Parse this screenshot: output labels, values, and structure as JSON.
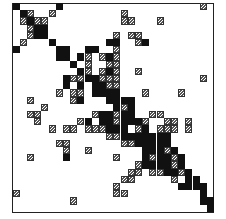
{
  "figure": {
    "type": "sparse-matrix-pattern",
    "grid": {
      "cols": 28,
      "rows": 29,
      "cell_w": 7.2,
      "cell_h": 7.2,
      "origin_x": 13,
      "origin_y": 3.5
    },
    "legend": {
      "b": "filled (black)",
      "h": "hatched"
    },
    "colors": {
      "filled": "#111111",
      "hatched_stroke": "#555555",
      "border": "#222222"
    },
    "cells": [
      [
        0,
        0,
        "b"
      ],
      [
        0,
        6,
        "b"
      ],
      [
        0,
        26,
        "h"
      ],
      [
        1,
        1,
        "b"
      ],
      [
        1,
        2,
        "h"
      ],
      [
        1,
        5,
        "h"
      ],
      [
        1,
        15,
        "h"
      ],
      [
        2,
        1,
        "h"
      ],
      [
        2,
        2,
        "b"
      ],
      [
        2,
        3,
        "h"
      ],
      [
        2,
        4,
        "h"
      ],
      [
        2,
        15,
        "h"
      ],
      [
        2,
        16,
        "h"
      ],
      [
        2,
        20,
        "h"
      ],
      [
        3,
        2,
        "h"
      ],
      [
        3,
        3,
        "b"
      ],
      [
        3,
        4,
        "b"
      ],
      [
        4,
        2,
        "h"
      ],
      [
        4,
        3,
        "b"
      ],
      [
        4,
        4,
        "b"
      ],
      [
        4,
        14,
        "h"
      ],
      [
        4,
        16,
        "h"
      ],
      [
        4,
        17,
        "h"
      ],
      [
        5,
        1,
        "h"
      ],
      [
        5,
        5,
        "b"
      ],
      [
        5,
        13,
        "b"
      ],
      [
        5,
        14,
        "b"
      ],
      [
        5,
        17,
        "h"
      ],
      [
        5,
        18,
        "b"
      ],
      [
        6,
        0,
        "b"
      ],
      [
        6,
        6,
        "b"
      ],
      [
        6,
        7,
        "b"
      ],
      [
        6,
        14,
        "h"
      ],
      [
        6,
        10,
        "b"
      ],
      [
        6,
        11,
        "b"
      ],
      [
        7,
        6,
        "b"
      ],
      [
        7,
        7,
        "b"
      ],
      [
        7,
        9,
        "b"
      ],
      [
        7,
        10,
        "h"
      ],
      [
        7,
        12,
        "h"
      ],
      [
        7,
        13,
        "b"
      ],
      [
        7,
        14,
        "h"
      ],
      [
        8,
        8,
        "b"
      ],
      [
        8,
        10,
        "h"
      ],
      [
        8,
        13,
        "h"
      ],
      [
        8,
        14,
        "h"
      ],
      [
        9,
        9,
        "b"
      ],
      [
        9,
        10,
        "h"
      ],
      [
        9,
        12,
        "h"
      ],
      [
        9,
        13,
        "b"
      ],
      [
        9,
        14,
        "h"
      ],
      [
        9,
        17,
        "h"
      ],
      [
        10,
        7,
        "b"
      ],
      [
        10,
        8,
        "h"
      ],
      [
        10,
        9,
        "h"
      ],
      [
        10,
        10,
        "b"
      ],
      [
        10,
        11,
        "b"
      ],
      [
        10,
        12,
        "h"
      ],
      [
        10,
        13,
        "h"
      ],
      [
        10,
        14,
        "h"
      ],
      [
        10,
        26,
        "h"
      ],
      [
        11,
        7,
        "b"
      ],
      [
        11,
        9,
        "b"
      ],
      [
        11,
        11,
        "b"
      ],
      [
        11,
        12,
        "b"
      ],
      [
        11,
        13,
        "h"
      ],
      [
        11,
        14,
        "h"
      ],
      [
        12,
        6,
        "h"
      ],
      [
        12,
        8,
        "h"
      ],
      [
        12,
        9,
        "h"
      ],
      [
        12,
        11,
        "b"
      ],
      [
        12,
        12,
        "b"
      ],
      [
        12,
        13,
        "b"
      ],
      [
        12,
        14,
        "b"
      ],
      [
        12,
        18,
        "h"
      ],
      [
        12,
        23,
        "h"
      ],
      [
        13,
        2,
        "h"
      ],
      [
        13,
        8,
        "h"
      ],
      [
        13,
        9,
        "b"
      ],
      [
        13,
        13,
        "b"
      ],
      [
        13,
        14,
        "b"
      ],
      [
        13,
        15,
        "b"
      ],
      [
        13,
        16,
        "b"
      ],
      [
        14,
        4,
        "h"
      ],
      [
        14,
        14,
        "b"
      ],
      [
        14,
        15,
        "h"
      ],
      [
        14,
        16,
        "b"
      ],
      [
        15,
        2,
        "h"
      ],
      [
        15,
        3,
        "h"
      ],
      [
        15,
        11,
        "h"
      ],
      [
        15,
        12,
        "b"
      ],
      [
        15,
        13,
        "b"
      ],
      [
        15,
        14,
        "h"
      ],
      [
        15,
        15,
        "b"
      ],
      [
        15,
        16,
        "b"
      ],
      [
        15,
        19,
        "h"
      ],
      [
        15,
        20,
        "h"
      ],
      [
        16,
        3,
        "h"
      ],
      [
        16,
        9,
        "h"
      ],
      [
        16,
        10,
        "b"
      ],
      [
        16,
        12,
        "b"
      ],
      [
        16,
        13,
        "b"
      ],
      [
        16,
        14,
        "h"
      ],
      [
        16,
        15,
        "b"
      ],
      [
        16,
        16,
        "b"
      ],
      [
        16,
        17,
        "b"
      ],
      [
        16,
        18,
        "h"
      ],
      [
        16,
        21,
        "h"
      ],
      [
        16,
        22,
        "h"
      ],
      [
        16,
        24,
        "h"
      ],
      [
        17,
        5,
        "h"
      ],
      [
        17,
        7,
        "h"
      ],
      [
        17,
        8,
        "h"
      ],
      [
        17,
        10,
        "h"
      ],
      [
        17,
        11,
        "h"
      ],
      [
        17,
        12,
        "h"
      ],
      [
        17,
        13,
        "b"
      ],
      [
        17,
        14,
        "b"
      ],
      [
        17,
        15,
        "b"
      ],
      [
        17,
        17,
        "h"
      ],
      [
        17,
        18,
        "b"
      ],
      [
        17,
        20,
        "h"
      ],
      [
        17,
        21,
        "h"
      ],
      [
        17,
        22,
        "h"
      ],
      [
        17,
        24,
        "h"
      ],
      [
        18,
        13,
        "h"
      ],
      [
        18,
        14,
        "h"
      ],
      [
        18,
        15,
        "b"
      ],
      [
        18,
        16,
        "b"
      ],
      [
        18,
        17,
        "b"
      ],
      [
        18,
        18,
        "b"
      ],
      [
        18,
        19,
        "b"
      ],
      [
        18,
        20,
        "b"
      ],
      [
        18,
        21,
        "b"
      ],
      [
        19,
        6,
        "h"
      ],
      [
        19,
        7,
        "h"
      ],
      [
        19,
        15,
        "h"
      ],
      [
        19,
        16,
        "h"
      ],
      [
        19,
        17,
        "b"
      ],
      [
        19,
        18,
        "b"
      ],
      [
        19,
        19,
        "b"
      ],
      [
        19,
        20,
        "b"
      ],
      [
        19,
        21,
        "b"
      ],
      [
        20,
        7,
        "h"
      ],
      [
        20,
        10,
        "h"
      ],
      [
        20,
        18,
        "b"
      ],
      [
        20,
        19,
        "b"
      ],
      [
        20,
        20,
        "b"
      ],
      [
        20,
        21,
        "h"
      ],
      [
        20,
        22,
        "b"
      ],
      [
        21,
        2,
        "h"
      ],
      [
        21,
        7,
        "b"
      ],
      [
        21,
        14,
        "h"
      ],
      [
        21,
        18,
        "b"
      ],
      [
        21,
        19,
        "h"
      ],
      [
        21,
        20,
        "b"
      ],
      [
        21,
        21,
        "b"
      ],
      [
        21,
        22,
        "h"
      ],
      [
        21,
        23,
        "b"
      ],
      [
        22,
        17,
        "h"
      ],
      [
        22,
        18,
        "b"
      ],
      [
        22,
        19,
        "b"
      ],
      [
        22,
        20,
        "b"
      ],
      [
        22,
        21,
        "b"
      ],
      [
        22,
        22,
        "h"
      ],
      [
        22,
        23,
        "b"
      ],
      [
        23,
        16,
        "h"
      ],
      [
        23,
        17,
        "h"
      ],
      [
        23,
        19,
        "h"
      ],
      [
        23,
        20,
        "h"
      ],
      [
        23,
        21,
        "b"
      ],
      [
        23,
        22,
        "b"
      ],
      [
        23,
        23,
        "h"
      ],
      [
        23,
        24,
        "b"
      ],
      [
        24,
        15,
        "h"
      ],
      [
        24,
        16,
        "h"
      ],
      [
        24,
        22,
        "h"
      ],
      [
        24,
        24,
        "b"
      ],
      [
        24,
        25,
        "b"
      ],
      [
        25,
        14,
        "h"
      ],
      [
        25,
        23,
        "b"
      ],
      [
        25,
        24,
        "b"
      ],
      [
        25,
        25,
        "b"
      ],
      [
        25,
        26,
        "b"
      ],
      [
        26,
        0,
        "h"
      ],
      [
        26,
        14,
        "h"
      ],
      [
        26,
        15,
        "h"
      ],
      [
        26,
        26,
        "b"
      ],
      [
        27,
        8,
        "h"
      ],
      [
        27,
        26,
        "b"
      ],
      [
        27,
        27,
        "b"
      ],
      [
        28,
        27,
        "b"
      ]
    ]
  }
}
